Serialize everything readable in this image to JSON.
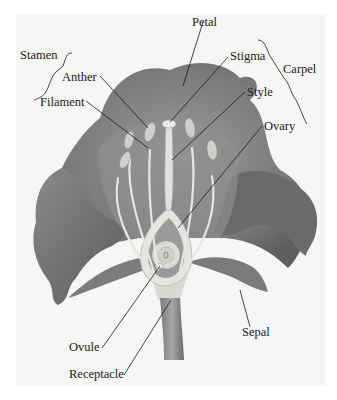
{
  "diagram": {
    "labels": {
      "stamen": "Stamen",
      "anther": "Anther",
      "filament": "Filament",
      "petal": "Petal",
      "stigma": "Stigma",
      "style": "Style",
      "carpel": "Carpel",
      "ovary": "Ovary",
      "ovule": "Ovule",
      "receptacle": "Receptacle",
      "sepal": "Sepal"
    },
    "groups": {
      "stamen": [
        "Anther",
        "Filament"
      ],
      "carpel": [
        "Stigma",
        "Style",
        "Ovary"
      ]
    },
    "colors": {
      "petal_dark": "#6e6e6e",
      "petal_mid": "#8c8c8c",
      "petal_light": "#b4b4b4",
      "structure_light": "#e6e6e2",
      "background": "#f6f6f4",
      "leader_line": "#1a1a1a"
    }
  }
}
